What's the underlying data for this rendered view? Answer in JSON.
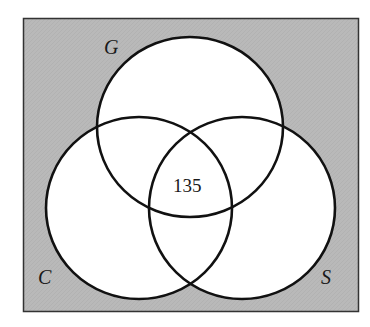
{
  "diagram": {
    "type": "venn",
    "universe": {
      "fill": "#b8b8b8",
      "stroke": "#333333"
    },
    "sets": [
      {
        "id": "G",
        "label": "G"
      },
      {
        "id": "C",
        "label": "C"
      },
      {
        "id": "S",
        "label": "S"
      }
    ],
    "regions": {
      "G_and_C_and_S": "135"
    },
    "colors": {
      "circle_fill": "#ffffff",
      "circle_stroke": "#111111",
      "text": "#1a1a1a"
    }
  }
}
